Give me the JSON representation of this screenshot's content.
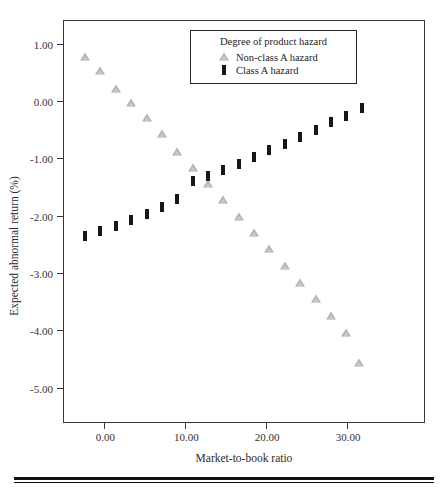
{
  "chart_data": {
    "type": "scatter",
    "title": "",
    "xlabel": "Market-to-book ratio",
    "ylabel": "Expected abnormal return (%)",
    "xlim": [
      -5.0,
      39.5
    ],
    "ylim": [
      -5.6,
      1.4
    ],
    "grid": false,
    "xticks": [
      0.0,
      10.0,
      20.0,
      30.0
    ],
    "xtick_labels": [
      "0.00",
      "10.00",
      "20.00",
      "30.00"
    ],
    "yticks": [
      1.0,
      0.0,
      -1.0,
      -2.0,
      -3.0,
      -4.0,
      -5.0
    ],
    "ytick_labels": [
      "1.00",
      "0.00",
      "-1.00",
      "-2.00",
      "-3.00",
      "-4.00",
      "-5.00"
    ],
    "legend": {
      "position": "top-center-inside",
      "title": "Degree of product hazard",
      "entries": [
        {
          "label": "Non-class A hazard",
          "marker": "triangle",
          "color": "#b3b3b3"
        },
        {
          "label": "Class A hazard",
          "marker": "vertical-bar",
          "color": "#171717"
        }
      ]
    },
    "series": [
      {
        "name": "Non-class A hazard",
        "marker": "triangle",
        "color": "#b3b3b3",
        "points": [
          {
            "x": -2.4,
            "y": 0.78
          },
          {
            "x": -0.5,
            "y": 0.53
          },
          {
            "x": 1.4,
            "y": 0.21
          },
          {
            "x": 3.3,
            "y": -0.03
          },
          {
            "x": 5.2,
            "y": -0.3
          },
          {
            "x": 7.1,
            "y": -0.58
          },
          {
            "x": 9.0,
            "y": -0.88
          },
          {
            "x": 10.9,
            "y": -1.16
          },
          {
            "x": 12.8,
            "y": -1.44
          },
          {
            "x": 14.7,
            "y": -1.72
          },
          {
            "x": 16.6,
            "y": -2.02
          },
          {
            "x": 18.5,
            "y": -2.3
          },
          {
            "x": 20.4,
            "y": -2.58
          },
          {
            "x": 22.3,
            "y": -2.88
          },
          {
            "x": 24.2,
            "y": -3.17
          },
          {
            "x": 26.1,
            "y": -3.46
          },
          {
            "x": 28.0,
            "y": -3.75
          },
          {
            "x": 29.9,
            "y": -4.05
          },
          {
            "x": 31.5,
            "y": -4.57
          }
        ]
      },
      {
        "name": "Class A hazard",
        "marker": "vertical-bar",
        "color": "#171717",
        "points": [
          {
            "x": -2.4,
            "y": -2.36
          },
          {
            "x": -0.5,
            "y": -2.27
          },
          {
            "x": 1.4,
            "y": -2.17
          },
          {
            "x": 3.3,
            "y": -2.07
          },
          {
            "x": 5.2,
            "y": -1.97
          },
          {
            "x": 7.1,
            "y": -1.85
          },
          {
            "x": 9.0,
            "y": -1.71
          },
          {
            "x": 10.9,
            "y": -1.4
          },
          {
            "x": 12.8,
            "y": -1.3
          },
          {
            "x": 14.7,
            "y": -1.2
          },
          {
            "x": 16.6,
            "y": -1.09
          },
          {
            "x": 18.5,
            "y": -0.97
          },
          {
            "x": 20.4,
            "y": -0.85
          },
          {
            "x": 22.3,
            "y": -0.74
          },
          {
            "x": 24.2,
            "y": -0.62
          },
          {
            "x": 26.1,
            "y": -0.5
          },
          {
            "x": 28.0,
            "y": -0.37
          },
          {
            "x": 29.9,
            "y": -0.25
          },
          {
            "x": 31.8,
            "y": -0.12
          }
        ]
      }
    ]
  }
}
